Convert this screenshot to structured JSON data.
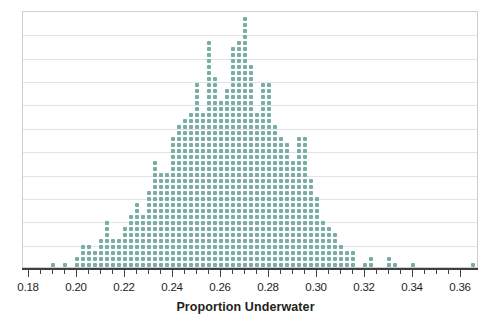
{
  "chart_data": {
    "type": "scatter",
    "plot_kind": "dot-plot",
    "title": "",
    "xlabel": "Proportion Underwater",
    "ylabel": "",
    "xlim": [
      0.1775,
      0.3675
    ],
    "ylim": [
      0,
      44
    ],
    "grid": true,
    "gridlines_y": [
      4,
      8,
      12,
      16,
      20,
      24,
      28,
      32,
      36,
      40
    ],
    "legend": null,
    "dot_value": 1,
    "dot_color": "#79aea3",
    "bin_width": 0.0025,
    "axis_ticks_major": [
      0.18,
      0.2,
      0.22,
      0.24,
      0.26,
      0.28,
      0.3,
      0.32,
      0.34,
      0.36
    ],
    "axis_tick_labels": [
      "0.18",
      "0.20",
      "0.22",
      "0.24",
      "0.26",
      "0.28",
      "0.30",
      "0.32",
      "0.34",
      "0.36"
    ],
    "axis_minor_step": 0.005,
    "x": [
      0.19,
      0.195,
      0.2,
      0.2025,
      0.205,
      0.2075,
      0.21,
      0.2125,
      0.215,
      0.2175,
      0.22,
      0.2225,
      0.225,
      0.2275,
      0.23,
      0.2325,
      0.235,
      0.2375,
      0.24,
      0.2425,
      0.245,
      0.2475,
      0.25,
      0.2525,
      0.255,
      0.2575,
      0.26,
      0.2625,
      0.265,
      0.2675,
      0.27,
      0.2725,
      0.275,
      0.2775,
      0.28,
      0.2825,
      0.285,
      0.2875,
      0.29,
      0.2925,
      0.295,
      0.2975,
      0.3,
      0.3025,
      0.305,
      0.3075,
      0.31,
      0.3125,
      0.315,
      0.32,
      0.3225,
      0.33,
      0.3325,
      0.34,
      0.365
    ],
    "counts": [
      1,
      1,
      2,
      4,
      4,
      3,
      5,
      8,
      5,
      5,
      7,
      9,
      11,
      9,
      13,
      18,
      16,
      16,
      22,
      24,
      25,
      26,
      31,
      26,
      38,
      32,
      28,
      30,
      37,
      38,
      42,
      34,
      26,
      31,
      31,
      24,
      22,
      21,
      18,
      22,
      22,
      15,
      12,
      8,
      7,
      6,
      4,
      3,
      3,
      1,
      2,
      2,
      1,
      1,
      1
    ],
    "n_total": 976,
    "peak_x": 0.27,
    "peak_count": 42
  }
}
